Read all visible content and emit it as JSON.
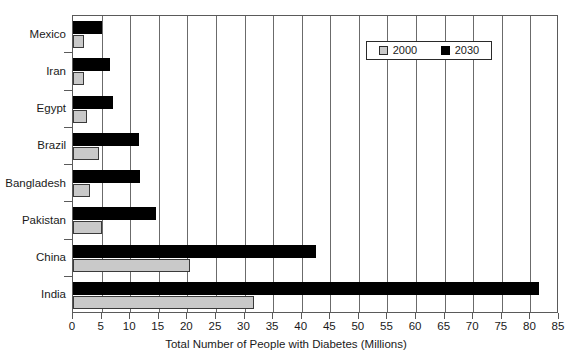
{
  "chart_data": {
    "type": "bar",
    "orientation": "horizontal",
    "title": "",
    "xlabel": "Total Number of People with Diabetes (Millions)",
    "ylabel": "",
    "xlim": [
      0,
      85
    ],
    "xticks": [
      0,
      5,
      10,
      15,
      20,
      25,
      30,
      35,
      40,
      45,
      50,
      55,
      60,
      65,
      70,
      75,
      80,
      85
    ],
    "grid": true,
    "grid_axis": "x",
    "legend_position": "top-right",
    "categories": [
      "Mexico",
      "Iran",
      "Egypt",
      "Brazil",
      "Bangladesh",
      "Pakistan",
      "China",
      "India"
    ],
    "series": [
      {
        "name": "2000",
        "color": "#c9c9c9",
        "values": [
          2.0,
          2.0,
          2.5,
          4.5,
          3.0,
          5.0,
          20.5,
          31.7
        ]
      },
      {
        "name": "2030",
        "color": "#000000",
        "values": [
          5.0,
          6.5,
          7.0,
          11.5,
          11.8,
          14.5,
          42.5,
          81.5
        ]
      }
    ]
  },
  "legend": {
    "entries": [
      {
        "label": "2000",
        "swatch": "gray-swatch"
      },
      {
        "label": "2030",
        "swatch": "black-swatch"
      }
    ]
  },
  "axis": {
    "x_title": "Total Number of People with Diabetes (Millions)",
    "x_tick_labels": [
      "0",
      "5",
      "10",
      "15",
      "20",
      "25",
      "30",
      "35",
      "40",
      "45",
      "50",
      "55",
      "60",
      "65",
      "70",
      "75",
      "80",
      "85"
    ],
    "y_tick_labels": [
      "Mexico",
      "Iran",
      "Egypt",
      "Brazil",
      "Bangladesh",
      "Pakistan",
      "China",
      "India"
    ]
  }
}
